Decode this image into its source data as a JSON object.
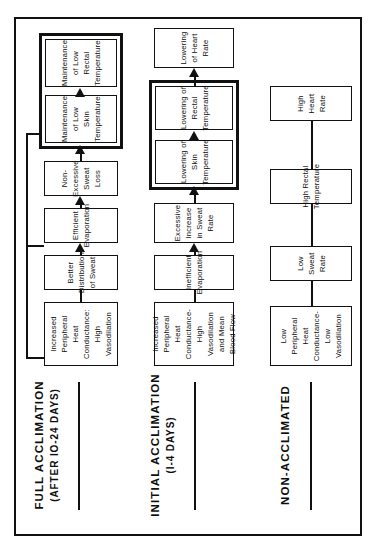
{
  "figure": {
    "orientation": "rotated-90-ccw",
    "bands": [
      {
        "id": "full-acclimation",
        "header": "FULL  ACCLIMATION",
        "subheader": "(AFTER IO-24 DAYS)",
        "nodes": [
          {
            "id": "full-n1",
            "label": "Increased Peripheral Heat\nConductance: High Vasodilation"
          },
          {
            "id": "full-n2",
            "label": "Better Distribution of Sweat"
          },
          {
            "id": "full-n3",
            "label": "Efficient Evaporation"
          },
          {
            "id": "full-n4",
            "label": "Non-Excessive Sweat Loss"
          },
          {
            "id": "full-n5",
            "label": "Maintenance of Low\nSkin Temperature"
          },
          {
            "id": "full-n6",
            "label": "Maintenance of Low\nRectal Temperature"
          }
        ]
      },
      {
        "id": "initial-acclimation",
        "header": "INITIAL  ACCLIMATION",
        "subheader": "(I-4 DAYS)",
        "nodes": [
          {
            "id": "init-n1",
            "label": "Increased Peripheral Heat\nConductance-High Vasodilation\nand Mean Blood Flow"
          },
          {
            "id": "init-n2",
            "label": "Inefficient Evaporation"
          },
          {
            "id": "init-n3",
            "label": "Excessive Increase\nin Sweat Rate"
          },
          {
            "id": "init-n4",
            "label": "Lowering of Skin Temperature"
          },
          {
            "id": "init-n5",
            "label": "Lowering of Rectal Temperature"
          },
          {
            "id": "init-n6",
            "label": "Lowering of Heart Rate"
          }
        ]
      },
      {
        "id": "non-acclimated",
        "header": "NON-ACCLIMATED",
        "subheader": "",
        "nodes": [
          {
            "id": "non-n1",
            "label": "Low Peripheral Heat\nConductance-Low Vasodilation"
          },
          {
            "id": "non-n2",
            "label": "Low Sweat Rate"
          },
          {
            "id": "non-n3",
            "label": "High Rectal Temperature"
          },
          {
            "id": "non-n4",
            "label": "High Heart Rate"
          }
        ]
      }
    ],
    "colors": {
      "ink": "#111111",
      "paper": "#ffffff"
    }
  }
}
